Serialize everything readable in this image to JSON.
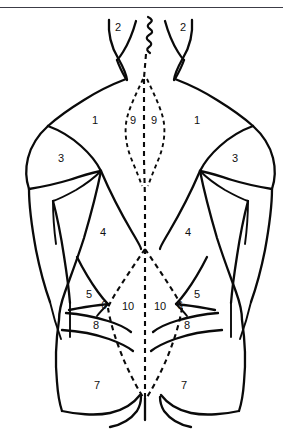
{
  "figure": {
    "view": "posterior",
    "background_color": "#ffffff",
    "line_color": "#0a0a0a",
    "rule_color": "#3c3c46",
    "midline_style": "dashed"
  },
  "labels": [
    {
      "id": "l-2-left",
      "text": "2",
      "x": 118,
      "y": 27,
      "region": "neck-left"
    },
    {
      "id": "l-2-right",
      "text": "2",
      "x": 183,
      "y": 27,
      "region": "neck-right"
    },
    {
      "id": "l-1-left",
      "text": "1",
      "x": 95,
      "y": 120,
      "region": "upper-back-left"
    },
    {
      "id": "l-9-left",
      "text": "9",
      "x": 133,
      "y": 120,
      "region": "paraspinal-left"
    },
    {
      "id": "l-9-right",
      "text": "9",
      "x": 154,
      "y": 120,
      "region": "paraspinal-right"
    },
    {
      "id": "l-1-right",
      "text": "1",
      "x": 197,
      "y": 120,
      "region": "upper-back-right"
    },
    {
      "id": "l-3-left",
      "text": "3",
      "x": 61,
      "y": 158,
      "region": "deltoid-left"
    },
    {
      "id": "l-3-right",
      "text": "3",
      "x": 235,
      "y": 158,
      "region": "deltoid-right"
    },
    {
      "id": "l-4-left",
      "text": "4",
      "x": 103,
      "y": 232,
      "region": "mid-back-left"
    },
    {
      "id": "l-4-right",
      "text": "4",
      "x": 188,
      "y": 232,
      "region": "mid-back-right"
    },
    {
      "id": "l-5-left",
      "text": "5",
      "x": 89,
      "y": 294,
      "region": "flank-left"
    },
    {
      "id": "l-5-right",
      "text": "5",
      "x": 197,
      "y": 294,
      "region": "flank-right"
    },
    {
      "id": "l-6-left",
      "text": "6",
      "x": 104,
      "y": 306,
      "region": "small-lateral-left"
    },
    {
      "id": "l-6-right",
      "text": "6",
      "x": 180,
      "y": 306,
      "region": "small-lateral-right"
    },
    {
      "id": "l-10-left",
      "text": "10",
      "x": 128,
      "y": 306,
      "region": "lumbar-left"
    },
    {
      "id": "l-10-right",
      "text": "10",
      "x": 160,
      "y": 306,
      "region": "lumbar-right"
    },
    {
      "id": "l-8-left",
      "text": "8",
      "x": 96,
      "y": 325,
      "region": "iliac-left"
    },
    {
      "id": "l-8-right",
      "text": "8",
      "x": 187,
      "y": 325,
      "region": "iliac-right"
    },
    {
      "id": "l-7-left",
      "text": "7",
      "x": 97,
      "y": 385,
      "region": "gluteal-left"
    },
    {
      "id": "l-7-right",
      "text": "7",
      "x": 184,
      "y": 385,
      "region": "gluteal-right"
    }
  ]
}
